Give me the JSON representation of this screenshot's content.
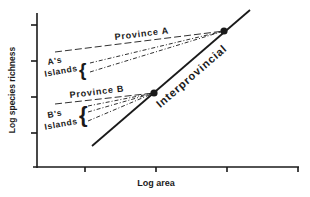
{
  "figure": {
    "x_axis_label": "Log area",
    "y_axis_label": "Log species richness",
    "x_ticks": 4,
    "y_ticks": 4
  },
  "labels": {
    "province_a": "Province A",
    "province_b": "Province B",
    "a_islands_line1": "A's",
    "a_islands_line2": "Islands",
    "b_islands_line1": "B's",
    "b_islands_line2": "Islands",
    "interprovincial": "Interprovincial"
  },
  "colors": {
    "ink": "#1a1a1a",
    "background": "#ffffff"
  },
  "diagram": {
    "nodes": [
      {
        "id": "province-a-point",
        "label": "Province A",
        "x": 224,
        "y": 31
      },
      {
        "id": "province-b-point",
        "label": "Province B",
        "x": 154,
        "y": 93
      }
    ],
    "edges": [
      {
        "id": "interprovincial-line",
        "style": "solid",
        "from": [
          92,
          146
        ],
        "to": [
          250,
          10
        ]
      },
      {
        "id": "province-a-line",
        "style": "dashed",
        "from": [
          55,
          52
        ],
        "to": [
          224,
          31
        ]
      },
      {
        "id": "a-island-line-1",
        "style": "dash-dot",
        "from": [
          90,
          63
        ],
        "to": [
          224,
          31
        ]
      },
      {
        "id": "a-island-line-2",
        "style": "dash-dot",
        "from": [
          90,
          72
        ],
        "to": [
          224,
          31
        ]
      },
      {
        "id": "province-b-line",
        "style": "dashed",
        "from": [
          55,
          104
        ],
        "to": [
          154,
          93
        ]
      },
      {
        "id": "b-island-line-1",
        "style": "dash-dot",
        "from": [
          88,
          106
        ],
        "to": [
          154,
          93
        ]
      },
      {
        "id": "b-island-line-2",
        "style": "dash-dot",
        "from": [
          88,
          112
        ],
        "to": [
          154,
          93
        ]
      },
      {
        "id": "b-island-line-3",
        "style": "dash-dot",
        "from": [
          88,
          121
        ],
        "to": [
          154,
          93
        ]
      }
    ]
  }
}
